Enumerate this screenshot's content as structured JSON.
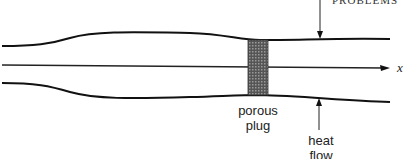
{
  "header": {
    "running_title": "PROBLEMS"
  },
  "diagram": {
    "axis_label": "x",
    "plug_label": [
      "porous",
      "plug"
    ],
    "heat_label": [
      "heat",
      "flow"
    ]
  }
}
